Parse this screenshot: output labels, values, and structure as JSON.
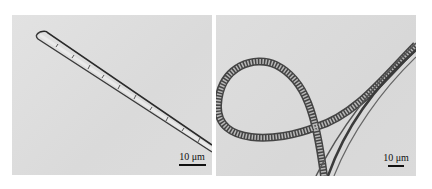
{
  "figure": {
    "panels": [
      {
        "id": "left",
        "description": "Straight segmented filament (micrograph)",
        "scale_bar_label": "10 μm"
      },
      {
        "id": "right",
        "description": "Looped helical filaments crossing (micrograph)",
        "scale_bar_label": "10 μm"
      }
    ],
    "colors": {
      "background": "#ffffff",
      "panel_bg": "#dddddd",
      "filament_dark": "#333333"
    }
  }
}
